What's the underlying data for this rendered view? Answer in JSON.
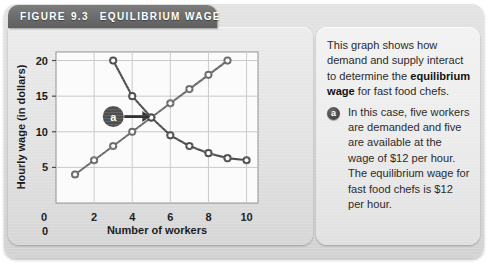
{
  "figure": {
    "header": {
      "prefix": "FIGURE",
      "number": "9.3",
      "title": "EQUILIBRIUM WAGE"
    }
  },
  "caption": {
    "intro_before_bold": "This graph shows how demand and supply interact to determine the ",
    "bold_term": "equilibrium wage",
    "intro_after_bold": " for fast food chefs.",
    "bullet_marker": "a",
    "bullet_text": "In this case, five workers are demanded and five are available at the wage of $12 per hour. The equilibrium wage for fast food chefs is $12 per hour."
  },
  "chart_data": {
    "type": "line",
    "title": "",
    "xlabel": "Number of workers",
    "ylabel": "Hourly wage (in dollars)",
    "xlim": [
      0,
      10.6
    ],
    "ylim": [
      0,
      21.2
    ],
    "xticks": [
      0,
      2,
      4,
      6,
      8,
      10
    ],
    "yticks": [
      0,
      5,
      10,
      15,
      20
    ],
    "grid": true,
    "legend_position": "none",
    "annotations": [
      {
        "label": "a",
        "kind": "circle-marker-with-arrow",
        "points_to_x": 5,
        "points_to_y": 12,
        "note": "equilibrium point: 5 workers at $12 per hour"
      }
    ],
    "series": [
      {
        "name": "supply",
        "x": [
          1,
          2,
          3,
          4,
          5,
          6,
          7,
          8,
          9
        ],
        "y": [
          4,
          6,
          8,
          10,
          12,
          14,
          16,
          18,
          20
        ],
        "color": "#6b6b6b"
      },
      {
        "name": "demand",
        "x": [
          3,
          4,
          5,
          6,
          7,
          8,
          9,
          10
        ],
        "y": [
          20,
          15,
          12,
          9.5,
          8,
          7,
          6.3,
          6
        ],
        "color": "#4e4e4e"
      }
    ]
  }
}
